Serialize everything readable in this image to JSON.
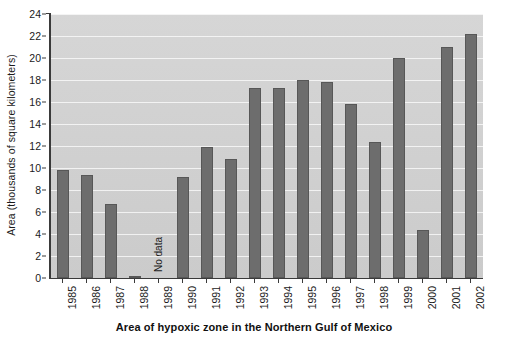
{
  "chart_data": {
    "type": "bar",
    "title": "Area of hypoxic zone in the Northern Gulf of Mexico",
    "xlabel": "",
    "ylabel": "Area (thousands of square kilometers)",
    "ylim": [
      0,
      24
    ],
    "ytick_step": 2,
    "grid": true,
    "legend": null,
    "categories": [
      "1985",
      "1986",
      "1987",
      "1988",
      "1989",
      "1990",
      "1991",
      "1992",
      "1993",
      "1994",
      "1995",
      "1996",
      "1997",
      "1998",
      "1999",
      "2000",
      "2001",
      "2002"
    ],
    "values": [
      9.8,
      9.4,
      6.7,
      0.1,
      null,
      9.2,
      11.9,
      10.8,
      17.3,
      17.3,
      18.0,
      17.8,
      15.8,
      12.4,
      20.0,
      4.4,
      21.0,
      22.2
    ],
    "ytick_labels": [
      "0",
      "2",
      "4",
      "6",
      "8",
      "10",
      "12",
      "14",
      "16",
      "18",
      "20",
      "22",
      "24"
    ],
    "annotations": [
      {
        "category": "1989",
        "text": "No data",
        "orientation": "vertical"
      }
    ],
    "colors": {
      "bar_fill": "#6d6d6d",
      "bar_stroke": "#575757",
      "plot_background": "#d2d2d2",
      "gridline": "#ffffff",
      "axis": "#3a3a3a",
      "text": "#1a1a1a"
    }
  }
}
